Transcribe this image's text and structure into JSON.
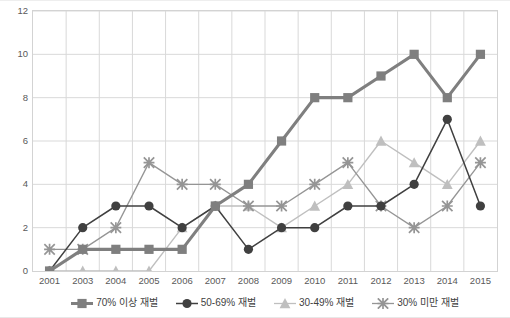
{
  "chart_data": {
    "type": "line",
    "title": "",
    "subtitle": "",
    "xlabel": "",
    "ylabel": "",
    "categories": [
      "2001",
      "2003",
      "2004",
      "2005",
      "2006",
      "2007",
      "2008",
      "2009",
      "2010",
      "2011",
      "2012",
      "2013",
      "2014",
      "2015"
    ],
    "ylim": [
      0,
      12
    ],
    "ytick_values": [
      0,
      2,
      4,
      6,
      8,
      10,
      12
    ],
    "ytick_labels": [
      "0",
      "2",
      "4",
      "6",
      "8",
      "10",
      "12"
    ],
    "grid": true,
    "grid_axis": "both",
    "legend_position": "bottom",
    "series": [
      {
        "name": "70% 이상 재벌",
        "marker": "square",
        "color": "#7f7f7f",
        "values": [
          0,
          1,
          1,
          1,
          1,
          3,
          4,
          6,
          8,
          8,
          9,
          10,
          8,
          10
        ]
      },
      {
        "name": "50-69% 재벌",
        "marker": "circle",
        "color": "#404040",
        "values": [
          0,
          2,
          3,
          3,
          2,
          3,
          1,
          2,
          2,
          3,
          3,
          4,
          7,
          3
        ]
      },
      {
        "name": "30-49% 재벌",
        "marker": "triangle",
        "color": "#bfbfbf",
        "values": [
          0,
          0,
          0,
          0,
          2,
          3,
          3,
          2,
          3,
          4,
          6,
          5,
          4,
          6
        ]
      },
      {
        "name": "30% 미만 재벌",
        "marker": "cross",
        "color": "#959595",
        "values": [
          1,
          1,
          2,
          5,
          4,
          4,
          3,
          3,
          4,
          5,
          3,
          2,
          3,
          5
        ]
      }
    ]
  },
  "axes": {
    "plot_border_color": "#d3d3d3",
    "grid_color": "#d9d9d9",
    "tick_label_color": "#595959"
  },
  "legend": {
    "items": [
      {
        "label": "70% 이상 재벌",
        "marker": "square-marker-icon"
      },
      {
        "label": "50-69% 재벌",
        "marker": "circle-marker-icon"
      },
      {
        "label": "30-49% 재벌",
        "marker": "triangle-marker-icon"
      },
      {
        "label": "30% 미만 재벌",
        "marker": "cross-marker-icon"
      }
    ]
  }
}
